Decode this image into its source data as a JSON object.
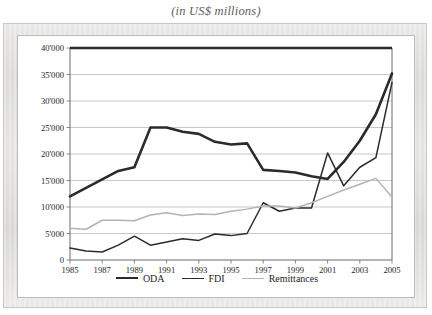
{
  "caption": "(in US$ millions)",
  "legend": {
    "position": "bottom-center",
    "items": [
      {
        "label": "ODA",
        "color": "#2b2b2b"
      },
      {
        "label": "FDI",
        "color": "#2b2b2b"
      },
      {
        "label": "Remittances",
        "color": "#b3b3b3"
      }
    ]
  },
  "axis": {
    "y_ticks": [
      "0",
      "5'000",
      "10'000",
      "15'000",
      "20'000",
      "25'000",
      "30'000",
      "35'000",
      "40'000"
    ],
    "x_ticks": [
      "1985",
      "1987",
      "1989",
      "1991",
      "1993",
      "1995",
      "1997",
      "1999",
      "2001",
      "2003",
      "2005"
    ]
  },
  "chart_data": {
    "type": "line",
    "title": "(in US$ millions)",
    "xlabel": "",
    "ylabel": "",
    "ylim": [
      0,
      40000
    ],
    "xlim": [
      1985,
      2005
    ],
    "grid": true,
    "grid_axis": "y",
    "ytick_values": [
      0,
      5000,
      10000,
      15000,
      20000,
      25000,
      30000,
      35000,
      40000
    ],
    "ytick_labels": [
      "0",
      "5'000",
      "10'000",
      "15'000",
      "20'000",
      "25'000",
      "30'000",
      "35'000",
      "40'000"
    ],
    "x": [
      1985,
      1986,
      1987,
      1988,
      1989,
      1990,
      1991,
      1992,
      1993,
      1994,
      1995,
      1996,
      1997,
      1998,
      1999,
      2000,
      2001,
      2002,
      2003,
      2004,
      2005
    ],
    "xtick_values": [
      1985,
      1987,
      1989,
      1991,
      1993,
      1995,
      1997,
      1999,
      2001,
      2003,
      2005
    ],
    "xtick_labels": [
      "1985",
      "1987",
      "1989",
      "1991",
      "1993",
      "1995",
      "1997",
      "1999",
      "2001",
      "2003",
      "2005"
    ],
    "legend_position": "bottom-center",
    "series": [
      {
        "name": "ODA",
        "color": "#2b2b2b",
        "width": 2.6,
        "values": [
          12000,
          13600,
          15200,
          16800,
          17500,
          25000,
          25000,
          24200,
          23800,
          22300,
          21800,
          22000,
          17000,
          16800,
          16500,
          15800,
          15300,
          18500,
          22500,
          27500,
          35200
        ]
      },
      {
        "name": "FDI",
        "color": "#2b2b2b",
        "width": 1.5,
        "values": [
          2250,
          1700,
          1500,
          2800,
          4500,
          2800,
          3400,
          4000,
          3700,
          4900,
          4600,
          5000,
          10800,
          9200,
          9800,
          9800,
          20200,
          14000,
          17500,
          19300,
          33500
        ]
      },
      {
        "name": "Remittances",
        "color": "#b3b3b3",
        "width": 1.5,
        "values": [
          6000,
          5800,
          7500,
          7500,
          7400,
          8500,
          8900,
          8400,
          8700,
          8600,
          9200,
          9600,
          10200,
          10200,
          9800,
          10800,
          12000,
          13200,
          14300,
          15400,
          11900
        ]
      }
    ]
  }
}
